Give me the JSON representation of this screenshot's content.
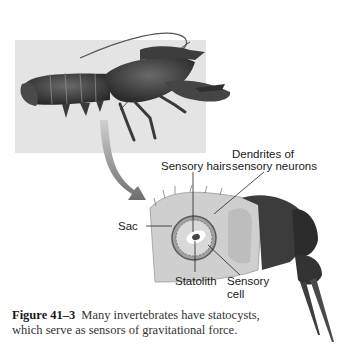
{
  "figure": {
    "labels": {
      "sensory_hairs": "Sensory hairs",
      "dendrites_line1": "Dendrites of",
      "dendrites_line2": "sensory neurons",
      "sac": "Sac",
      "statolith": "Statolith",
      "sensory_cell_line1": "Sensory",
      "sensory_cell_line2": "cell"
    },
    "caption": {
      "number": "Figure 41–3",
      "text": "Many invertebrates have statocysts, which serve as sensors of gravitational force."
    },
    "colors": {
      "panel_gray": "#e4e4e4",
      "arrow": "#8a8a8a",
      "body_dark": "#3a3a3a",
      "sac_fill": "#c8c8c8"
    }
  }
}
